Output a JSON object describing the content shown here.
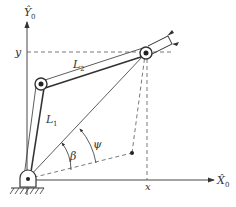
{
  "diagram": {
    "type": "two-link planar manipulator geometry",
    "axes": {
      "x_axis_label": "X̂",
      "x_axis_subscript": "0",
      "y_axis_label": "Ŷ",
      "y_axis_subscript": "0"
    },
    "coordinates": {
      "x_label": "x",
      "y_label": "y"
    },
    "links": {
      "link1_label": "L",
      "link1_subscript": "1",
      "link2_label": "L",
      "link2_subscript": "2"
    },
    "angles": {
      "beta": "β",
      "psi": "ψ"
    },
    "colors": {
      "line": "#333333",
      "background": "#ffffff"
    }
  }
}
